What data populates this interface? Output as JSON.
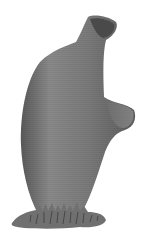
{
  "image": {
    "subject": "sponge-illustration",
    "background_color": "#ffffff",
    "body_color": "#7d7d7d",
    "base_color": "#6f6f6f"
  }
}
